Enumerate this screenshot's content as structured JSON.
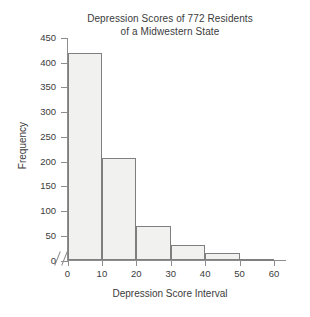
{
  "chart_data": {
    "type": "bar",
    "title": "Depression Scores of 772 Residents of a Midwestern State",
    "title_lines": [
      "Depression Scores of 772 Residents",
      "of a Midwestern State"
    ],
    "xlabel": "Depression Score Interval",
    "ylabel": "Frequency",
    "categories": [
      "0-10",
      "10-20",
      "20-30",
      "30-40",
      "40-50",
      "50-60"
    ],
    "bin_edges": [
      0,
      10,
      20,
      30,
      40,
      50,
      60
    ],
    "values": [
      420,
      208,
      70,
      32,
      15,
      4
    ],
    "xlim": [
      0,
      60
    ],
    "ylim": [
      0,
      450
    ],
    "xticks": [
      "0",
      "10",
      "20",
      "30",
      "40",
      "50",
      "60"
    ],
    "xtick_values": [
      0,
      10,
      20,
      30,
      40,
      50,
      60
    ],
    "yticks": [
      "0",
      "50",
      "100",
      "150",
      "200",
      "250",
      "300",
      "350",
      "400",
      "450"
    ],
    "ytick_values": [
      0,
      50,
      100,
      150,
      200,
      250,
      300,
      350,
      400,
      450
    ],
    "grid": false,
    "legend": null,
    "axis_break": "//",
    "colors": {
      "bar_fill": "#f1f1ef",
      "bar_border": "#7f7f7f",
      "axis": "#8d8d8d",
      "text": "#3b3b3b",
      "background": "#ffffff"
    }
  }
}
